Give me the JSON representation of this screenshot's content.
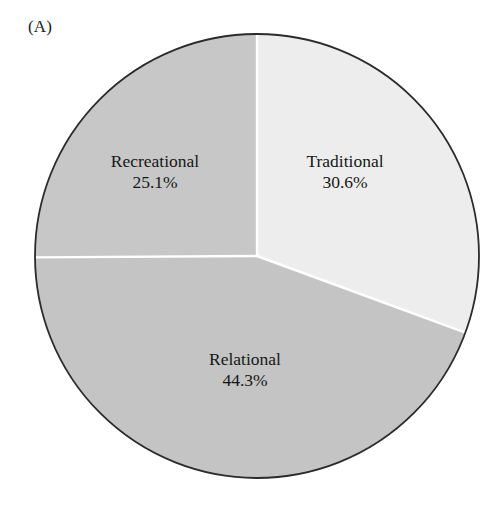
{
  "figure": {
    "panel_label": "(A)",
    "background_color": "#ffffff",
    "outline_color": "#2b2b2b",
    "divider_color": "#ffffff"
  },
  "chart_data": {
    "type": "pie",
    "title": "",
    "subtitle": "",
    "xlabel": "",
    "ylabel": "",
    "grid": false,
    "legend": "none",
    "label_format": "name-above-percent",
    "start_angle_deg": 0,
    "direction": "clockwise",
    "center": {
      "x": 257,
      "y": 256
    },
    "radius": 222,
    "categories": [
      "Traditional",
      "Relational",
      "Recreational"
    ],
    "values": [
      30.6,
      44.3,
      25.1
    ],
    "total": 100.0,
    "units": "%",
    "slices": [
      {
        "name": "Traditional",
        "value": 30.6,
        "value_label": "30.6%",
        "color": "#ededed",
        "start_angle_deg": 0.0,
        "end_angle_deg": 110.2
      },
      {
        "name": "Relational",
        "value": 44.3,
        "value_label": "44.3%",
        "color": "#c4c4c4",
        "start_angle_deg": 110.2,
        "end_angle_deg": 269.7
      },
      {
        "name": "Recreational",
        "value": 25.1,
        "value_label": "25.1%",
        "color": "#c7c7c7",
        "start_angle_deg": 269.7,
        "end_angle_deg": 360.0
      }
    ]
  }
}
